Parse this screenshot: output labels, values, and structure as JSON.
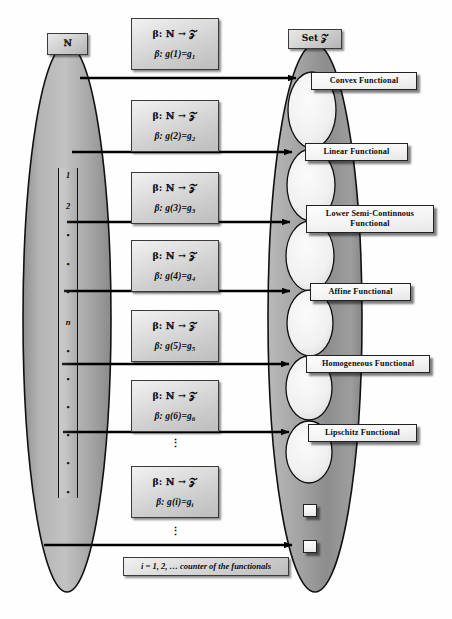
{
  "diagram": {
    "left_set": {
      "tag_label": "ℕ",
      "name": "natural-numbers-oval"
    },
    "right_set": {
      "tag_label": "Set 𝒵",
      "name": "functionals-oval"
    },
    "index_column": {
      "items": [
        "1",
        "2",
        "•",
        "•",
        "•",
        "n",
        "•",
        "•",
        "•",
        "•",
        "•",
        "•"
      ]
    },
    "caption": "i = 1, 2, … counter of the functionals",
    "mappings": [
      {
        "line1": "β: ℕ → 𝒵",
        "line2_prefix": "β: g(",
        "line2_arg": "1",
        "line2_mid": ")=g",
        "line2_sub": "1"
      },
      {
        "line1": "β: ℕ → 𝒵",
        "line2_prefix": "β: g(",
        "line2_arg": "2",
        "line2_mid": ")=g",
        "line2_sub": "2"
      },
      {
        "line1": "β: ℕ → 𝒵",
        "line2_prefix": "β: g(",
        "line2_arg": "3",
        "line2_mid": ")=g",
        "line2_sub": "3"
      },
      {
        "line1": "β: ℕ → 𝒵",
        "line2_prefix": "β: g(",
        "line2_arg": "4",
        "line2_mid": ")=g",
        "line2_sub": "4"
      },
      {
        "line1": "β: ℕ → 𝒵",
        "line2_prefix": "β: g(",
        "line2_arg": "5",
        "line2_mid": ")=g",
        "line2_sub": "5"
      },
      {
        "line1": "β: ℕ → 𝒵",
        "line2_prefix": "β: g(",
        "line2_arg": "6",
        "line2_mid": ")=g",
        "line2_sub": "6"
      },
      {
        "line1": "β: ℕ → 𝒵",
        "line2_prefix": "β: g(",
        "line2_arg": "i",
        "line2_mid": ")=g",
        "line2_sub": "i"
      }
    ],
    "functionals": [
      {
        "label": "Convex Functional"
      },
      {
        "label": "Linear Functional"
      },
      {
        "label": "Lower Semi-Continnous Functional"
      },
      {
        "label": "Affine Functional"
      },
      {
        "label": "Homogeneous Functional"
      },
      {
        "label": "Lipschitz Functional"
      },
      {
        "label": ""
      },
      {
        "label": ""
      }
    ],
    "ellipsis": "⋮",
    "colors": {
      "oval_fill": "#a8a8a8",
      "inner_ellipse": "#efefef",
      "outline": "#111111",
      "arrow": "#000000",
      "box_face": "#f4f4f4"
    }
  }
}
